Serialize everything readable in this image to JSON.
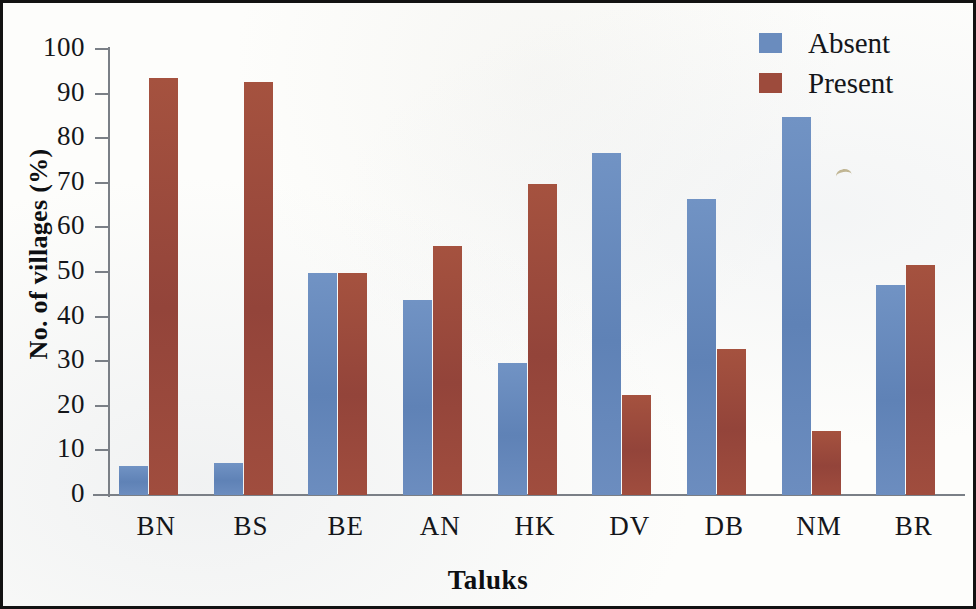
{
  "chart_data": {
    "type": "bar",
    "title": "",
    "xlabel": "Taluks",
    "ylabel": "No. of villages (%)",
    "categories": [
      "BN",
      "BS",
      "BE",
      "AN",
      "HK",
      "DV",
      "DB",
      "NM",
      "BR"
    ],
    "series": [
      {
        "name": "Absent",
        "color": "#6a8cbe",
        "values": [
          6.6,
          7.1,
          49.7,
          43.7,
          29.5,
          76.7,
          66.4,
          84.8,
          47.2
        ]
      },
      {
        "name": "Present",
        "color": "#9d4b3c",
        "values": [
          93.4,
          92.7,
          49.7,
          55.9,
          69.8,
          22.5,
          32.7,
          14.4,
          51.6
        ]
      }
    ],
    "ylim": [
      0,
      100
    ],
    "y_ticks": [
      0,
      10,
      20,
      30,
      40,
      50,
      60,
      70,
      80,
      90,
      100
    ],
    "y_tick_labels": [
      "0",
      "10",
      "20",
      "30",
      "40",
      "50",
      "60",
      "70",
      "80",
      "90",
      "100"
    ],
    "grid": false,
    "legend_position": "top-right",
    "frame_border_color": "#121212",
    "axis_color": "#7a7f86",
    "background_color": "#fdfdfb"
  },
  "legend": {
    "items": [
      {
        "label": "Absent",
        "color": "#6a8cbe"
      },
      {
        "label": "Present",
        "color": "#9d4b3c"
      }
    ]
  }
}
